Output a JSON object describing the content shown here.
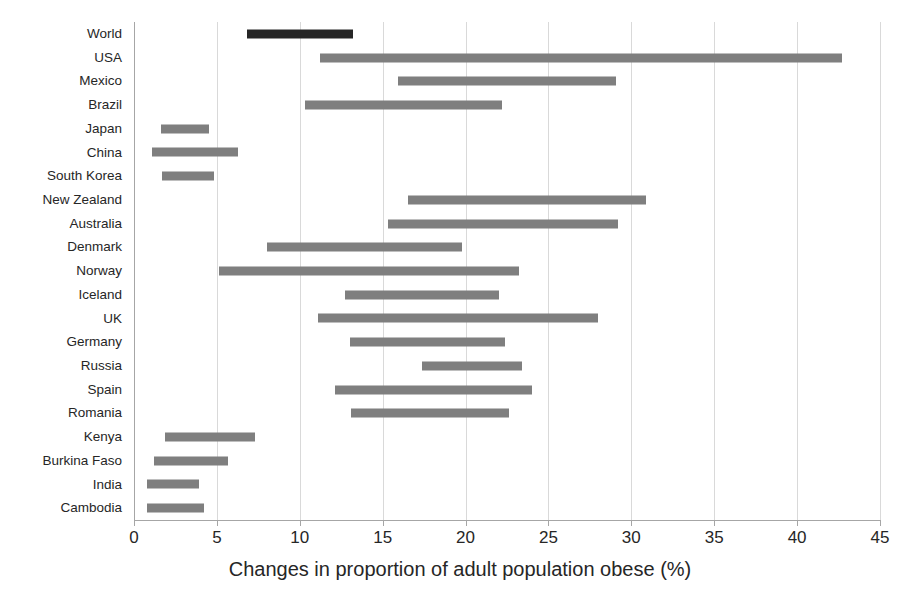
{
  "chart_data": {
    "type": "bar",
    "orientation": "horizontal",
    "subtype": "floating-range-bar",
    "title": "",
    "xlabel": "Changes in proportion of adult population obese (%)",
    "ylabel": "",
    "xlim": [
      0,
      45
    ],
    "xticks": [
      0,
      5,
      10,
      15,
      20,
      25,
      30,
      35,
      40,
      45
    ],
    "xtick_labels": [
      "0",
      "5",
      "10",
      "15",
      "20",
      "25",
      "30",
      "35",
      "40",
      "45"
    ],
    "grid": true,
    "grid_axis": "x",
    "legend": null,
    "bar_color": "#7f7f7f",
    "highlight_color": "#262626",
    "categories": [
      "World",
      "USA",
      "Mexico",
      "Brazil",
      "Japan",
      "China",
      "South Korea",
      "New Zealand",
      "Australia",
      "Denmark",
      "Norway",
      "Iceland",
      "UK",
      "Germany",
      "Russia",
      "Spain",
      "Romania",
      "Kenya",
      "Burkina Faso",
      "India",
      "Cambodia"
    ],
    "bars": [
      {
        "category": "World",
        "start": 6.8,
        "end": 13.2,
        "highlight": true
      },
      {
        "category": "USA",
        "start": 11.2,
        "end": 42.7,
        "highlight": false
      },
      {
        "category": "Mexico",
        "start": 15.9,
        "end": 29.1,
        "highlight": false
      },
      {
        "category": "Brazil",
        "start": 10.3,
        "end": 22.2,
        "highlight": false
      },
      {
        "category": "Japan",
        "start": 1.6,
        "end": 4.5,
        "highlight": false
      },
      {
        "category": "China",
        "start": 1.1,
        "end": 6.3,
        "highlight": false
      },
      {
        "category": "South Korea",
        "start": 1.7,
        "end": 4.8,
        "highlight": false
      },
      {
        "category": "New Zealand",
        "start": 16.5,
        "end": 30.9,
        "highlight": false
      },
      {
        "category": "Australia",
        "start": 15.3,
        "end": 29.2,
        "highlight": false
      },
      {
        "category": "Denmark",
        "start": 8.0,
        "end": 19.8,
        "highlight": false
      },
      {
        "category": "Norway",
        "start": 5.1,
        "end": 23.2,
        "highlight": false
      },
      {
        "category": "Iceland",
        "start": 12.7,
        "end": 22.0,
        "highlight": false
      },
      {
        "category": "UK",
        "start": 11.1,
        "end": 28.0,
        "highlight": false
      },
      {
        "category": "Germany",
        "start": 13.0,
        "end": 22.4,
        "highlight": false
      },
      {
        "category": "Russia",
        "start": 17.4,
        "end": 23.4,
        "highlight": false
      },
      {
        "category": "Spain",
        "start": 12.1,
        "end": 24.0,
        "highlight": false
      },
      {
        "category": "Romania",
        "start": 13.1,
        "end": 22.6,
        "highlight": false
      },
      {
        "category": "Kenya",
        "start": 1.9,
        "end": 7.3,
        "highlight": false
      },
      {
        "category": "Burkina Faso",
        "start": 1.2,
        "end": 5.7,
        "highlight": false
      },
      {
        "category": "India",
        "start": 0.8,
        "end": 3.9,
        "highlight": false
      },
      {
        "category": "Cambodia",
        "start": 0.8,
        "end": 4.2,
        "highlight": false
      }
    ]
  }
}
